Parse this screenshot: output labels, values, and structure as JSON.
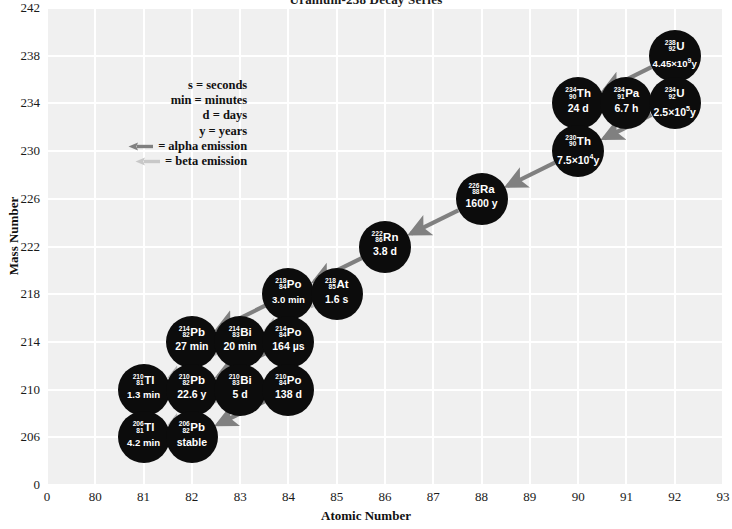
{
  "title": "Uranium-238 Decay Series",
  "axes": {
    "xlabel": "Atomic Number",
    "ylabel": "Mass Number",
    "xticks": [
      "0",
      "80",
      "81",
      "82",
      "83",
      "84",
      "85",
      "86",
      "87",
      "88",
      "89",
      "90",
      "91",
      "92",
      "93"
    ],
    "yticks": [
      "0",
      "206",
      "210",
      "214",
      "218",
      "222",
      "226",
      "230",
      "234",
      "238",
      "242"
    ]
  },
  "legend": {
    "items": [
      {
        "lhs": "s",
        "rhs": "= seconds"
      },
      {
        "lhs": "min",
        "rhs": "= minutes"
      },
      {
        "lhs": "d",
        "rhs": "= days"
      },
      {
        "lhs": "y",
        "rhs": "= years"
      }
    ],
    "alpha_label": "= alpha emission",
    "beta_label": "= beta emission",
    "alpha_color": "#808080",
    "beta_color": "#c8c8c8"
  },
  "colors": {
    "plot_background": "#f0f0f0",
    "gridline": "#ffffff",
    "node_fill": "#0c0c0c",
    "node_text": "#ffffff",
    "alpha_arrow": "#808080",
    "beta_arrow": "#c8c8c8"
  },
  "chart_data": {
    "type": "scatter",
    "title": "Uranium-238 Decay Series",
    "xlabel": "Atomic Number",
    "ylabel": "Mass Number",
    "xlim": [
      0,
      93
    ],
    "ylim": [
      0,
      242
    ],
    "grid": true,
    "legend_position": "upper-left-inside",
    "nodes": [
      {
        "id": "U238",
        "symbol": "U",
        "mass": "238",
        "atomic": "92",
        "halflife": "4.45×10",
        "exponent": "9",
        "unit": "y",
        "x": 92,
        "y": 238
      },
      {
        "id": "Th234",
        "symbol": "Th",
        "mass": "234",
        "atomic": "90",
        "halflife": "24 d",
        "exponent": "",
        "unit": "",
        "x": 90,
        "y": 234
      },
      {
        "id": "Pa234",
        "symbol": "Pa",
        "mass": "234",
        "atomic": "91",
        "halflife": "6.7 h",
        "exponent": "",
        "unit": "",
        "x": 91,
        "y": 234
      },
      {
        "id": "U234",
        "symbol": "U",
        "mass": "234",
        "atomic": "92",
        "halflife": "2.5×10",
        "exponent": "5",
        "unit": "y",
        "x": 92,
        "y": 234
      },
      {
        "id": "Th230",
        "symbol": "Th",
        "mass": "230",
        "atomic": "90",
        "halflife": "7.5×10",
        "exponent": "4",
        "unit": "y",
        "x": 90,
        "y": 230
      },
      {
        "id": "Ra226",
        "symbol": "Ra",
        "mass": "226",
        "atomic": "88",
        "halflife": "1600 y",
        "exponent": "",
        "unit": "",
        "x": 88,
        "y": 226
      },
      {
        "id": "Rn222",
        "symbol": "Rn",
        "mass": "222",
        "atomic": "86",
        "halflife": "3.8 d",
        "exponent": "",
        "unit": "",
        "x": 86,
        "y": 222
      },
      {
        "id": "Po218",
        "symbol": "Po",
        "mass": "218",
        "atomic": "84",
        "halflife": "3.0 min",
        "exponent": "",
        "unit": "",
        "x": 84,
        "y": 218
      },
      {
        "id": "At218",
        "symbol": "At",
        "mass": "218",
        "atomic": "85",
        "halflife": "1.6 s",
        "exponent": "",
        "unit": "",
        "x": 85,
        "y": 218
      },
      {
        "id": "Pb214",
        "symbol": "Pb",
        "mass": "214",
        "atomic": "82",
        "halflife": "27 min",
        "exponent": "",
        "unit": "",
        "x": 82,
        "y": 214
      },
      {
        "id": "Bi214",
        "symbol": "Bi",
        "mass": "214",
        "atomic": "83",
        "halflife": "20 min",
        "exponent": "",
        "unit": "",
        "x": 83,
        "y": 214
      },
      {
        "id": "Po214",
        "symbol": "Po",
        "mass": "214",
        "atomic": "84",
        "halflife": "164 µs",
        "exponent": "",
        "unit": "",
        "x": 84,
        "y": 214
      },
      {
        "id": "Tl210",
        "symbol": "Tl",
        "mass": "210",
        "atomic": "81",
        "halflife": "1.3 min",
        "exponent": "",
        "unit": "",
        "x": 81,
        "y": 210
      },
      {
        "id": "Pb210",
        "symbol": "Pb",
        "mass": "210",
        "atomic": "82",
        "halflife": "22.6 y",
        "exponent": "",
        "unit": "",
        "x": 82,
        "y": 210
      },
      {
        "id": "Bi210",
        "symbol": "Bi",
        "mass": "210",
        "atomic": "83",
        "halflife": "5 d",
        "exponent": "",
        "unit": "",
        "x": 83,
        "y": 210
      },
      {
        "id": "Po210",
        "symbol": "Po",
        "mass": "210",
        "atomic": "84",
        "halflife": "138 d",
        "exponent": "",
        "unit": "",
        "x": 84,
        "y": 210
      },
      {
        "id": "Tl206",
        "symbol": "Tl",
        "mass": "206",
        "atomic": "81",
        "halflife": "4.2 min",
        "exponent": "",
        "unit": "",
        "x": 81,
        "y": 206
      },
      {
        "id": "Pb206",
        "symbol": "Pb",
        "mass": "206",
        "atomic": "82",
        "halflife": "stable",
        "exponent": "",
        "unit": "",
        "x": 82,
        "y": 206
      }
    ],
    "decays": [
      {
        "from": "U238",
        "to": "Th234",
        "type": "alpha"
      },
      {
        "from": "Th234",
        "to": "Pa234",
        "type": "beta"
      },
      {
        "from": "Pa234",
        "to": "U234",
        "type": "beta"
      },
      {
        "from": "U234",
        "to": "Th230",
        "type": "alpha"
      },
      {
        "from": "Th230",
        "to": "Ra226",
        "type": "alpha"
      },
      {
        "from": "Ra226",
        "to": "Rn222",
        "type": "alpha"
      },
      {
        "from": "Rn222",
        "to": "Po218",
        "type": "alpha"
      },
      {
        "from": "Po218",
        "to": "At218",
        "type": "beta"
      },
      {
        "from": "Po218",
        "to": "Pb214",
        "type": "alpha"
      },
      {
        "from": "At218",
        "to": "Bi214",
        "type": "alpha-minor"
      },
      {
        "from": "Pb214",
        "to": "Bi214",
        "type": "beta"
      },
      {
        "from": "Bi214",
        "to": "Po214",
        "type": "beta"
      },
      {
        "from": "Bi214",
        "to": "Tl210",
        "type": "alpha-minor"
      },
      {
        "from": "Po214",
        "to": "Pb210",
        "type": "alpha"
      },
      {
        "from": "Tl210",
        "to": "Pb210",
        "type": "beta"
      },
      {
        "from": "Pb210",
        "to": "Bi210",
        "type": "beta"
      },
      {
        "from": "Bi210",
        "to": "Po210",
        "type": "beta"
      },
      {
        "from": "Bi210",
        "to": "Tl206",
        "type": "alpha-minor"
      },
      {
        "from": "Po210",
        "to": "Pb206",
        "type": "alpha"
      },
      {
        "from": "Tl206",
        "to": "Pb206",
        "type": "beta"
      }
    ]
  }
}
